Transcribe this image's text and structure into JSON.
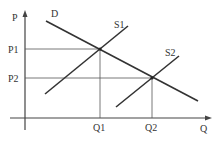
{
  "diagram": {
    "type": "supply-demand",
    "axes": {
      "y_label": "P",
      "x_label": "Q"
    },
    "curves": [
      {
        "name": "demand",
        "label": "D"
      },
      {
        "name": "supply-1",
        "label": "S1"
      },
      {
        "name": "supply-2",
        "label": "S2"
      }
    ],
    "equilibria": [
      {
        "price_label": "P1",
        "quantity_label": "Q1",
        "curves": [
          "D",
          "S1"
        ]
      },
      {
        "price_label": "P2",
        "quantity_label": "Q2",
        "curves": [
          "D",
          "S2"
        ]
      }
    ],
    "colors": {
      "line": "#333333",
      "background": "#ffffff"
    }
  }
}
